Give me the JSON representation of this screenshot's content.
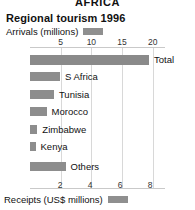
{
  "region_header": "AFRICA",
  "title": "Regional tourism 1996",
  "legend_top": {
    "label": "Arrivals (millions)",
    "swatch_name": "arrivals-swatch",
    "color": "#8f8f8f"
  },
  "legend_bottom": {
    "label": "Receipts (US$ millions)",
    "swatch_name": "receipts-swatch",
    "color": "#8f8f8f"
  },
  "chart_data": {
    "type": "bar",
    "orientation": "horizontal",
    "title": "Regional tourism 1996",
    "subtitle": "AFRICA",
    "categories": [
      "Total",
      "S Africa",
      "Tunisia",
      "Morocco",
      "Zimbabwe",
      "Kenya",
      "Others"
    ],
    "series": [
      {
        "name": "Arrivals (millions)",
        "unit": "millions",
        "color": "#8d8d8d",
        "values": [
          19.4,
          4.9,
          3.9,
          2.7,
          1.2,
          0.9,
          5.8
        ]
      }
    ],
    "top_axis": {
      "label": "Arrivals (millions)",
      "ticks": [
        5,
        10,
        15,
        20
      ],
      "range": [
        0,
        22
      ],
      "position": "top"
    },
    "bottom_axis": {
      "label": "Receipts (US$ millions)",
      "ticks": [
        2,
        4,
        6,
        8
      ],
      "range": [
        0,
        9
      ],
      "position": "bottom"
    },
    "grid": true,
    "legend": "inline-swatch",
    "xlabel": "Arrivals (millions)",
    "ylabel": ""
  },
  "ticks_top": [
    "5",
    "10",
    "15",
    "20"
  ],
  "ticks_bottom": [
    "2",
    "4",
    "6",
    "8"
  ],
  "bars": [
    {
      "label": "Total",
      "value": 19.4
    },
    {
      "label": "S Africa",
      "value": 4.9
    },
    {
      "label": "Tunisia",
      "value": 3.9
    },
    {
      "label": "Morocco",
      "value": 2.7
    },
    {
      "label": "Zimbabwe",
      "value": 1.2
    },
    {
      "label": "Kenya",
      "value": 0.9
    },
    {
      "label": "Others",
      "value": 5.8
    }
  ]
}
